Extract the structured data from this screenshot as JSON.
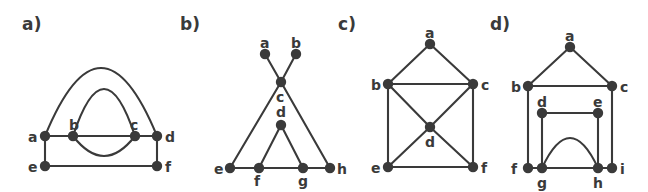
{
  "figure": {
    "width": 648,
    "height": 192,
    "background_color": "#ffffff",
    "ink_color": "#3a3a3a",
    "node_radius": 5.2,
    "edge_width": 2.1
  },
  "panels": [
    {
      "caption": "a)",
      "caption_pos": [
        22,
        14
      ],
      "nodes": [
        {
          "id": "a",
          "x": 45,
          "y": 136,
          "label_pos": [
            28,
            130
          ]
        },
        {
          "id": "b",
          "x": 73,
          "y": 136,
          "label_pos": [
            69,
            118
          ]
        },
        {
          "id": "c",
          "x": 135,
          "y": 136,
          "label_pos": [
            130,
            118
          ]
        },
        {
          "id": "d",
          "x": 157,
          "y": 136,
          "label_pos": [
            165,
            130
          ]
        },
        {
          "id": "e",
          "x": 45,
          "y": 166,
          "label_pos": [
            28,
            160
          ]
        },
        {
          "id": "f",
          "x": 157,
          "y": 166,
          "label_pos": [
            165,
            160
          ]
        }
      ],
      "edges": [
        {
          "from": "a",
          "to": "d",
          "kind": "arc",
          "bulge": -68,
          "note": "large outer arc above"
        },
        {
          "from": "b",
          "to": "c",
          "kind": "arc",
          "bulge": -47,
          "note": "inner arc above"
        },
        {
          "from": "b",
          "to": "c",
          "kind": "straight"
        },
        {
          "from": "b",
          "to": "c",
          "kind": "arc",
          "bulge": 20,
          "note": "small arc below"
        },
        {
          "from": "a",
          "to": "b",
          "kind": "straight"
        },
        {
          "from": "c",
          "to": "d",
          "kind": "straight"
        },
        {
          "from": "a",
          "to": "e",
          "kind": "straight"
        },
        {
          "from": "e",
          "to": "f",
          "kind": "straight"
        },
        {
          "from": "d",
          "to": "f",
          "kind": "straight"
        }
      ]
    },
    {
      "caption": "b)",
      "caption_pos": [
        180,
        14
      ],
      "nodes": [
        {
          "id": "a",
          "x": 265,
          "y": 54,
          "label_pos": [
            260,
            36
          ]
        },
        {
          "id": "b",
          "x": 296,
          "y": 54,
          "label_pos": [
            291,
            36
          ]
        },
        {
          "id": "c",
          "x": 281,
          "y": 82,
          "label_pos": [
            276,
            90
          ]
        },
        {
          "id": "d",
          "x": 281,
          "y": 125,
          "label_pos": [
            276,
            105
          ]
        },
        {
          "id": "e",
          "x": 230,
          "y": 168,
          "label_pos": [
            214,
            162
          ]
        },
        {
          "id": "f",
          "x": 259,
          "y": 168,
          "label_pos": [
            254,
            174
          ]
        },
        {
          "id": "g",
          "x": 303,
          "y": 168,
          "label_pos": [
            298,
            174
          ]
        },
        {
          "id": "h",
          "x": 330,
          "y": 168,
          "label_pos": [
            337,
            162
          ]
        }
      ],
      "edges": [
        {
          "from": "a",
          "to": "c",
          "kind": "straight"
        },
        {
          "from": "b",
          "to": "c",
          "kind": "straight"
        },
        {
          "from": "c",
          "to": "e",
          "kind": "straight"
        },
        {
          "from": "c",
          "to": "h",
          "kind": "straight"
        },
        {
          "from": "d",
          "to": "f",
          "kind": "straight"
        },
        {
          "from": "d",
          "to": "g",
          "kind": "straight"
        },
        {
          "from": "e",
          "to": "f",
          "kind": "straight"
        },
        {
          "from": "f",
          "to": "g",
          "kind": "straight"
        },
        {
          "from": "g",
          "to": "h",
          "kind": "straight"
        }
      ]
    },
    {
      "caption": "c)",
      "caption_pos": [
        338,
        14
      ],
      "nodes": [
        {
          "id": "a",
          "x": 430,
          "y": 44,
          "label_pos": [
            425,
            26
          ]
        },
        {
          "id": "b",
          "x": 388,
          "y": 84,
          "label_pos": [
            371,
            78
          ]
        },
        {
          "id": "c",
          "x": 473,
          "y": 84,
          "label_pos": [
            481,
            78
          ]
        },
        {
          "id": "d",
          "x": 430,
          "y": 127,
          "label_pos": [
            425,
            135
          ]
        },
        {
          "id": "e",
          "x": 388,
          "y": 167,
          "label_pos": [
            371,
            161
          ]
        },
        {
          "id": "f",
          "x": 473,
          "y": 167,
          "label_pos": [
            481,
            161
          ]
        }
      ],
      "edges": [
        {
          "from": "a",
          "to": "b",
          "kind": "straight"
        },
        {
          "from": "a",
          "to": "c",
          "kind": "straight"
        },
        {
          "from": "b",
          "to": "c",
          "kind": "straight"
        },
        {
          "from": "b",
          "to": "d",
          "kind": "straight"
        },
        {
          "from": "c",
          "to": "d",
          "kind": "straight"
        },
        {
          "from": "b",
          "to": "e",
          "kind": "straight"
        },
        {
          "from": "c",
          "to": "f",
          "kind": "straight"
        },
        {
          "from": "d",
          "to": "e",
          "kind": "straight"
        },
        {
          "from": "d",
          "to": "f",
          "kind": "straight"
        },
        {
          "from": "e",
          "to": "f",
          "kind": "straight"
        }
      ]
    },
    {
      "caption": "d)",
      "caption_pos": [
        490,
        14
      ],
      "nodes": [
        {
          "id": "a",
          "x": 570,
          "y": 47,
          "label_pos": [
            565,
            29
          ]
        },
        {
          "id": "b",
          "x": 528,
          "y": 86,
          "label_pos": [
            511,
            80
          ]
        },
        {
          "id": "c",
          "x": 612,
          "y": 86,
          "label_pos": [
            620,
            80
          ]
        },
        {
          "id": "d",
          "x": 542,
          "y": 113,
          "label_pos": [
            537,
            95
          ]
        },
        {
          "id": "e",
          "x": 598,
          "y": 113,
          "label_pos": [
            593,
            95
          ]
        },
        {
          "id": "f",
          "x": 528,
          "y": 168,
          "label_pos": [
            511,
            162
          ]
        },
        {
          "id": "g",
          "x": 542,
          "y": 168,
          "label_pos": [
            537,
            176
          ]
        },
        {
          "id": "h",
          "x": 598,
          "y": 168,
          "label_pos": [
            593,
            176
          ]
        },
        {
          "id": "i",
          "x": 612,
          "y": 168,
          "label_pos": [
            620,
            162
          ]
        }
      ],
      "edges": [
        {
          "from": "a",
          "to": "b",
          "kind": "straight"
        },
        {
          "from": "a",
          "to": "c",
          "kind": "straight"
        },
        {
          "from": "b",
          "to": "c",
          "kind": "straight"
        },
        {
          "from": "d",
          "to": "e",
          "kind": "straight"
        },
        {
          "from": "b",
          "to": "f",
          "kind": "straight"
        },
        {
          "from": "c",
          "to": "i",
          "kind": "straight"
        },
        {
          "from": "d",
          "to": "g",
          "kind": "straight"
        },
        {
          "from": "e",
          "to": "h",
          "kind": "straight"
        },
        {
          "from": "f",
          "to": "g",
          "kind": "straight"
        },
        {
          "from": "g",
          "to": "h",
          "kind": "straight"
        },
        {
          "from": "h",
          "to": "i",
          "kind": "straight"
        },
        {
          "from": "g",
          "to": "h",
          "kind": "arc",
          "bulge": -30,
          "note": "arc above bottom line"
        }
      ]
    }
  ]
}
